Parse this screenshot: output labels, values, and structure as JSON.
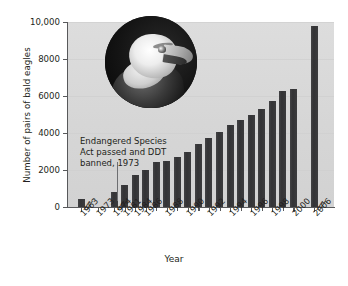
{
  "chart_data": {
    "type": "bar",
    "title": "",
    "xlabel": "Year",
    "ylabel": "Number of pairs of bald eagles",
    "ylim": [
      0,
      10000
    ],
    "yticks": [
      "0",
      "2000",
      "4000",
      "6000",
      "8000",
      "10,000"
    ],
    "ytick_values": [
      0,
      2000,
      4000,
      6000,
      8000,
      10000
    ],
    "grid": true,
    "legend": "none",
    "axis_breaks": [
      "after 1963",
      "after 1974",
      "after 2000"
    ],
    "break_symbol": "//",
    "categories": [
      "1963",
      "1973",
      "1974",
      "1981",
      "1984",
      "1986",
      "1988",
      "1990",
      "1992",
      "1994",
      "1996",
      "1998",
      "2000",
      "2006"
    ],
    "tick_labels": [
      "1963",
      "1973",
      "1974",
      "1981",
      "1984",
      "1986",
      "1988",
      "1990",
      "1992",
      "1994",
      "1996",
      "1998",
      "2000",
      "2006"
    ],
    "values": [
      420,
      0,
      790,
      1200,
      1750,
      2000,
      2500,
      3000,
      3750,
      4450,
      5000,
      5750,
      6400,
      9800
    ],
    "bars": [
      {
        "year": "1963",
        "value": 420
      },
      {
        "year": "1974",
        "value": 790
      },
      {
        "year": "1981",
        "value": 1200
      },
      {
        "year": "1984",
        "value": 1750
      },
      {
        "year": "1986",
        "value": 2000
      },
      {
        "year": "1987",
        "value": 2450
      },
      {
        "year": "1988",
        "value": 2500
      },
      {
        "year": "1989",
        "value": 2700
      },
      {
        "year": "1990",
        "value": 3000
      },
      {
        "year": "1991",
        "value": 3400
      },
      {
        "year": "1992",
        "value": 3750
      },
      {
        "year": "1993",
        "value": 4050
      },
      {
        "year": "1994",
        "value": 4450
      },
      {
        "year": "1995",
        "value": 4700
      },
      {
        "year": "1996",
        "value": 5000
      },
      {
        "year": "1997",
        "value": 5300
      },
      {
        "year": "1998",
        "value": 5750
      },
      {
        "year": "1999",
        "value": 6250
      },
      {
        "year": "2000",
        "value": 6400
      },
      {
        "year": "2006",
        "value": 9800
      }
    ],
    "annotation": {
      "line1": "Endangered Species",
      "line2": "Act passed and DDT",
      "line3": "banned, 1973",
      "marker_year": "1973"
    },
    "inset": {
      "name": "bald-eagle-photo",
      "shape": "circle"
    },
    "colors": {
      "bar": "#3a3a3c",
      "plot_background": "#d9d9d9",
      "axis": "#58595b",
      "text": "#231f20",
      "gridline": "#cfcfcf"
    }
  }
}
